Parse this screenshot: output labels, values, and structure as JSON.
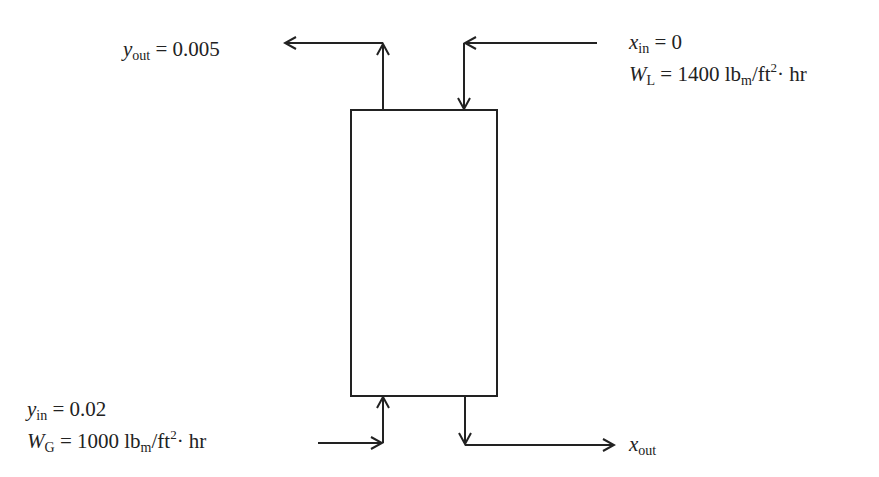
{
  "diagram": {
    "type": "countercurrent absorption column",
    "labels": {
      "gas_out": {
        "var": "y",
        "sub": "out",
        "value": "= 0.005"
      },
      "liquid_in": {
        "var": "x",
        "sub": "in",
        "value": "= 0"
      },
      "liquid_flow": {
        "var": "W",
        "sub": "L",
        "eq": "= 1400 lb",
        "unit_sub": "m",
        "unit_mid": "/ft",
        "unit_sup": "2",
        "unit_end": "· hr"
      },
      "gas_in": {
        "var": "y",
        "sub": "in",
        "value": "= 0.02"
      },
      "gas_flow": {
        "var": "W",
        "sub": "G",
        "eq": "= 1000 lb",
        "unit_sub": "m",
        "unit_mid": "/ft",
        "unit_sup": "2",
        "unit_end": "· hr"
      },
      "liquid_out": {
        "var": "x",
        "sub": "out"
      }
    },
    "stroke_color": "#222222"
  }
}
